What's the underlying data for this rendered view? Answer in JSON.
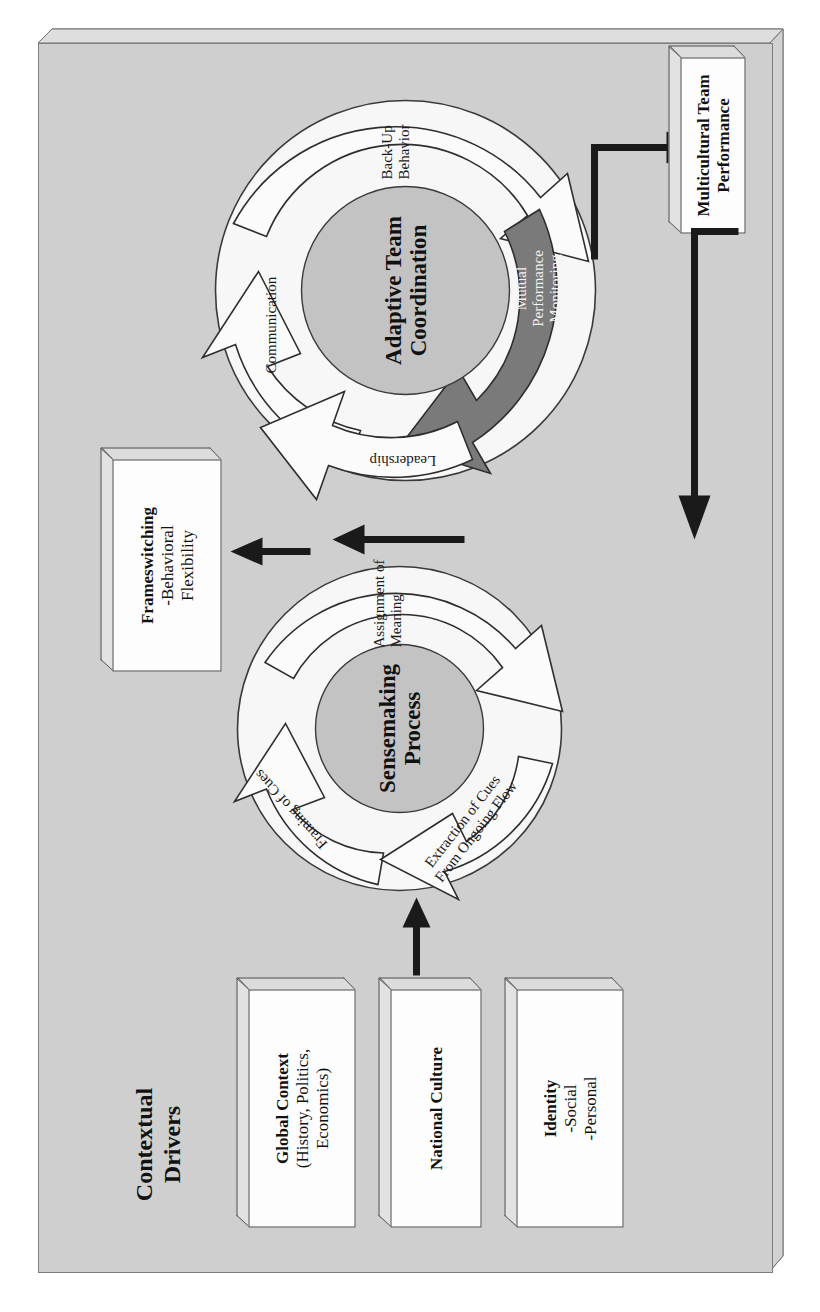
{
  "figure": {
    "panel_bg": "#cfcfcf",
    "accent_dark": "#7a7a7a",
    "arrow_fill": "#fafafa",
    "stroke": "#3a3a3a",
    "orientation": "rotated-90-ccw"
  },
  "contextual": {
    "title_line1": "Contextual",
    "title_line2": "Drivers",
    "boxes": [
      {
        "heading": "Global Context",
        "sub1": "(History, Politics,",
        "sub2": "Economics)"
      },
      {
        "heading": "National Culture",
        "sub1": "",
        "sub2": ""
      },
      {
        "heading": "Identity",
        "sub1": "-Social",
        "sub2": "-Personal"
      }
    ]
  },
  "sensemaking": {
    "hub_line1": "Sensemaking",
    "hub_line2": "Process",
    "segments": [
      {
        "label": "Framing of Cues"
      },
      {
        "label": "Assignment of\nMeaning",
        "l1": "Assignment of",
        "l2": "Meaning"
      },
      {
        "label": "Extraction of Cues\nFrom Ongoing Flow",
        "l1": "Extraction of Cues",
        "l2": "From Ongoing Flow"
      }
    ]
  },
  "frameswitching": {
    "heading": "Frameswitching",
    "sub1": "-Behavioral",
    "sub2": "Flexibility"
  },
  "coordination": {
    "hub_line1": "Adaptive Team",
    "hub_line2": "Coordination",
    "segments": [
      {
        "label": "Communication",
        "shade": "light"
      },
      {
        "label": "Back-Up Behavior",
        "l1": "Back-Up",
        "l2": "Behavior",
        "shade": "light"
      },
      {
        "label": "Mutual Performance Monitoring",
        "l1": "Mutual",
        "l2": "Performance",
        "l3": "Monitoring",
        "shade": "dark"
      },
      {
        "label": "Leadership",
        "shade": "light"
      }
    ]
  },
  "performance": {
    "heading": "Multicultural Team",
    "sub1": "Performance"
  }
}
